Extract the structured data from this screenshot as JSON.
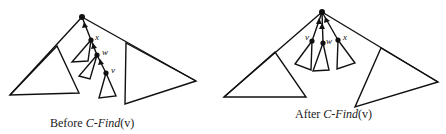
{
  "panels": [
    {
      "id": "before",
      "caption_prefix": "Before ",
      "caption_func": "C-Find",
      "caption_arg": "(v)",
      "labels": {
        "x": "x",
        "w": "w",
        "v": "v"
      }
    },
    {
      "id": "after",
      "caption_prefix": "After ",
      "caption_func": "C-Find",
      "caption_arg": "(v)",
      "labels": {
        "v": "v",
        "w": "w",
        "x": "x"
      }
    }
  ],
  "colors": {
    "stroke": "#111111",
    "background": "#ffffff"
  }
}
